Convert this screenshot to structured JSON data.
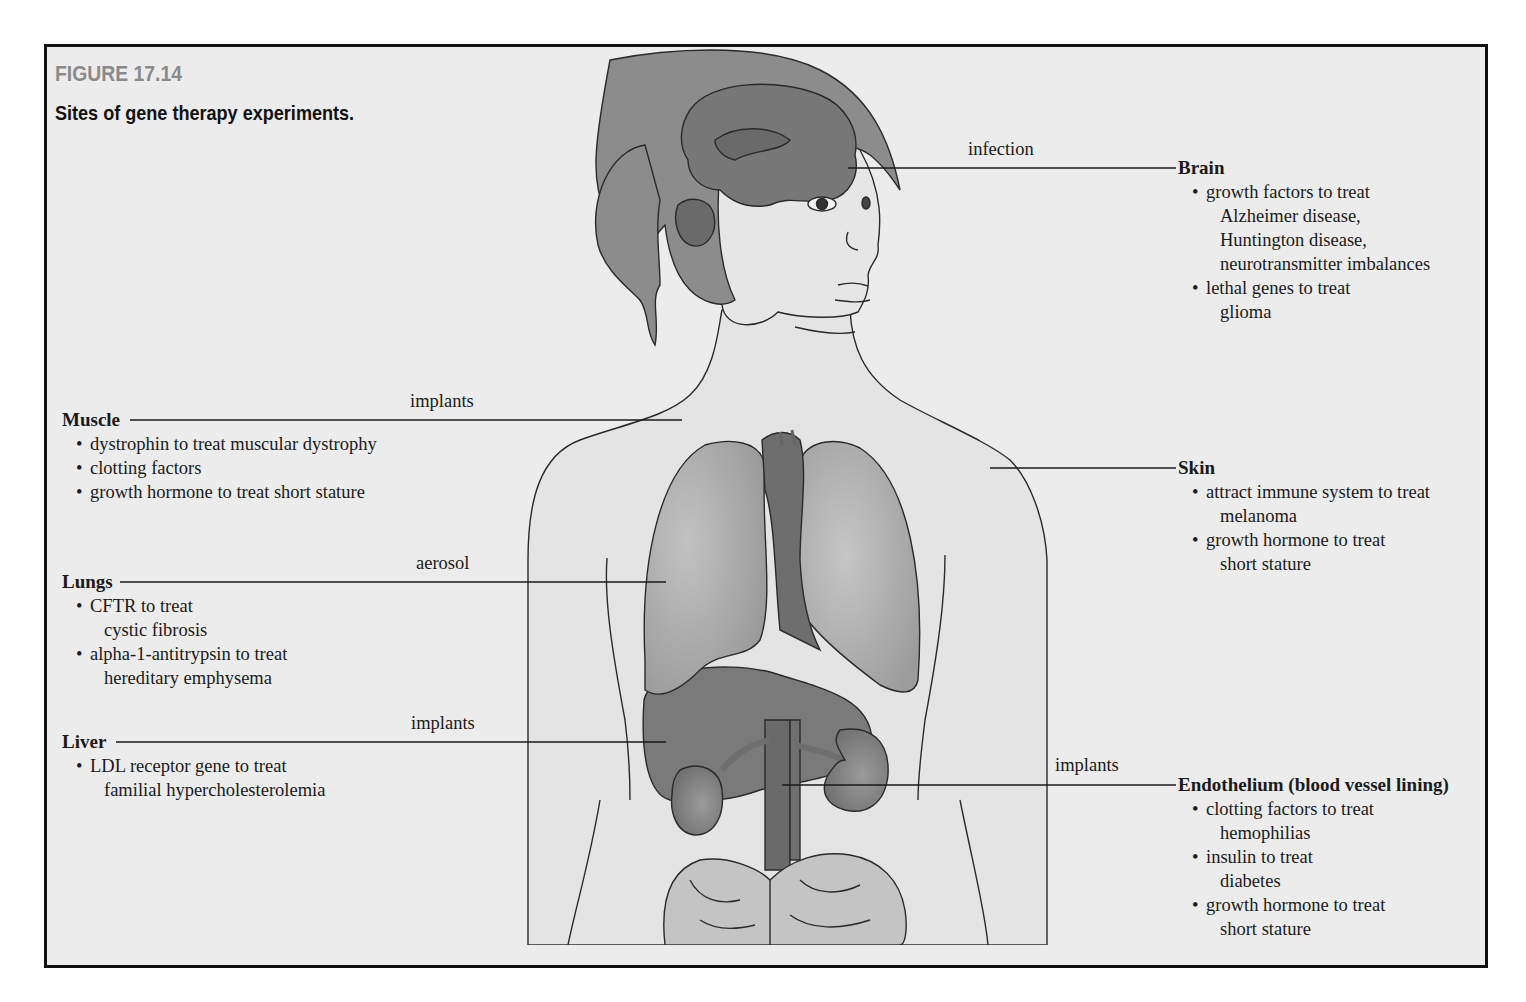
{
  "figure": {
    "number": "FIGURE 17.14",
    "caption": "Sites of gene therapy experiments."
  },
  "colors": {
    "background": "#ececec",
    "frame_border": "#111111",
    "figure_number": "#8a8a8a",
    "skin": "#e4e4e4",
    "hair": "#8c8c8c",
    "brain": "#777777",
    "organ_light": "#a8a8a8",
    "organ_dark": "#6e6e6e",
    "intestine": "#c4c4c4"
  },
  "sites": {
    "brain": {
      "route": "infection",
      "title": "Brain",
      "bullets": [
        {
          "lines": [
            "growth factors to treat",
            "Alzheimer disease,",
            "Huntington disease,",
            "neurotransmitter imbalances"
          ]
        },
        {
          "lines": [
            "lethal genes to treat",
            "glioma"
          ]
        }
      ]
    },
    "muscle": {
      "route": "implants",
      "title": "Muscle",
      "bullets": [
        {
          "lines": [
            "dystrophin to treat muscular dystrophy"
          ]
        },
        {
          "lines": [
            "clotting factors"
          ]
        },
        {
          "lines": [
            "growth hormone to treat short stature"
          ]
        }
      ]
    },
    "skin": {
      "title": "Skin",
      "bullets": [
        {
          "lines": [
            "attract immune system to treat",
            "melanoma"
          ]
        },
        {
          "lines": [
            "growth hormone to treat",
            "short stature"
          ]
        }
      ]
    },
    "lungs": {
      "route": "aerosol",
      "title": "Lungs",
      "bullets": [
        {
          "lines": [
            "CFTR to treat",
            "cystic fibrosis"
          ]
        },
        {
          "lines": [
            "alpha-1-antitrypsin to treat",
            "hereditary emphysema"
          ]
        }
      ]
    },
    "liver": {
      "route": "implants",
      "title": "Liver",
      "bullets": [
        {
          "lines": [
            "LDL receptor gene to treat",
            "familial hypercholesterolemia"
          ]
        }
      ]
    },
    "endothelium": {
      "route": "implants",
      "title": "Endothelium (blood vessel lining)",
      "bullets": [
        {
          "lines": [
            "clotting factors to treat",
            "hemophilias"
          ]
        },
        {
          "lines": [
            "insulin to treat",
            "diabetes"
          ]
        },
        {
          "lines": [
            "growth hormone to treat",
            "short stature"
          ]
        }
      ]
    }
  },
  "bullet_char": "•"
}
